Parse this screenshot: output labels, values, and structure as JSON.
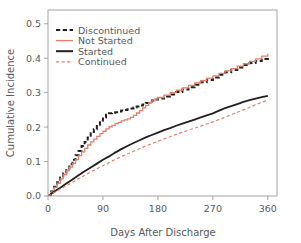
{
  "chart_data": {
    "type": "line",
    "title": "",
    "xlabel": "Days After Discharge",
    "ylabel": "Cumulative Incidence",
    "xlim": [
      0,
      375
    ],
    "ylim": [
      0,
      0.54
    ],
    "xticks": [
      0,
      90,
      180,
      270,
      360
    ],
    "xticklabels": [
      "0",
      "90",
      "180",
      "270",
      "360"
    ],
    "yticks": [
      0.0,
      0.1,
      0.2,
      0.3,
      0.4,
      0.5
    ],
    "yticklabels": [
      "0.0",
      "0.1",
      "0.2",
      "0.3",
      "0.4",
      "0.5"
    ],
    "grid": false,
    "legend_position": "upper-left",
    "colors": {
      "black": "#231f20",
      "red": "#e0806d",
      "axis": "#9a9a9a",
      "text": "#58595b",
      "background": "#ffffff"
    },
    "series": [
      {
        "name": "Discontinued",
        "color": "#231f20",
        "style": "dashed",
        "width": 2.0,
        "x": [
          0,
          5,
          10,
          15,
          20,
          25,
          30,
          35,
          40,
          45,
          50,
          55,
          60,
          65,
          70,
          75,
          80,
          85,
          90,
          95,
          100,
          105,
          110,
          115,
          120,
          125,
          130,
          135,
          140,
          145,
          150,
          155,
          160,
          165,
          170,
          175,
          180,
          190,
          200,
          210,
          220,
          230,
          240,
          250,
          260,
          270,
          280,
          290,
          300,
          310,
          320,
          330,
          340,
          350,
          360
        ],
        "y": [
          0.0,
          0.013,
          0.027,
          0.04,
          0.054,
          0.066,
          0.079,
          0.092,
          0.105,
          0.118,
          0.131,
          0.145,
          0.157,
          0.17,
          0.182,
          0.194,
          0.207,
          0.219,
          0.228,
          0.236,
          0.24,
          0.242,
          0.243,
          0.245,
          0.248,
          0.25,
          0.252,
          0.254,
          0.257,
          0.26,
          0.263,
          0.266,
          0.27,
          0.274,
          0.277,
          0.28,
          0.283,
          0.289,
          0.295,
          0.302,
          0.309,
          0.316,
          0.323,
          0.33,
          0.337,
          0.344,
          0.352,
          0.359,
          0.366,
          0.373,
          0.38,
          0.386,
          0.392,
          0.398,
          0.403
        ]
      },
      {
        "name": "Not Started",
        "color": "#e0806d",
        "style": "solid",
        "width": 1.3,
        "x": [
          0,
          5,
          10,
          15,
          20,
          25,
          30,
          35,
          40,
          45,
          50,
          55,
          60,
          65,
          70,
          75,
          80,
          85,
          90,
          95,
          100,
          105,
          110,
          115,
          120,
          125,
          130,
          135,
          140,
          145,
          150,
          155,
          160,
          165,
          170,
          175,
          180,
          190,
          200,
          210,
          220,
          230,
          240,
          250,
          260,
          270,
          280,
          290,
          300,
          310,
          320,
          330,
          340,
          350,
          360
        ],
        "y": [
          0.0,
          0.012,
          0.025,
          0.037,
          0.05,
          0.062,
          0.073,
          0.084,
          0.095,
          0.106,
          0.117,
          0.128,
          0.138,
          0.148,
          0.157,
          0.165,
          0.173,
          0.181,
          0.188,
          0.195,
          0.201,
          0.205,
          0.21,
          0.214,
          0.218,
          0.221,
          0.224,
          0.228,
          0.234,
          0.241,
          0.248,
          0.256,
          0.263,
          0.27,
          0.276,
          0.281,
          0.286,
          0.293,
          0.3,
          0.307,
          0.314,
          0.321,
          0.328,
          0.335,
          0.342,
          0.349,
          0.356,
          0.363,
          0.37,
          0.377,
          0.384,
          0.391,
          0.398,
          0.406,
          0.413
        ]
      },
      {
        "name": "Started",
        "color": "#231f20",
        "style": "solid",
        "width": 1.8,
        "x": [
          0,
          10,
          20,
          30,
          40,
          50,
          60,
          70,
          80,
          90,
          100,
          110,
          120,
          130,
          140,
          150,
          160,
          170,
          180,
          190,
          200,
          210,
          220,
          230,
          240,
          250,
          260,
          270,
          280,
          290,
          300,
          310,
          320,
          330,
          340,
          350,
          360
        ],
        "y": [
          0.0,
          0.012,
          0.024,
          0.036,
          0.048,
          0.06,
          0.072,
          0.083,
          0.094,
          0.105,
          0.115,
          0.126,
          0.136,
          0.145,
          0.154,
          0.162,
          0.17,
          0.177,
          0.184,
          0.191,
          0.197,
          0.204,
          0.21,
          0.216,
          0.222,
          0.228,
          0.234,
          0.24,
          0.248,
          0.255,
          0.261,
          0.267,
          0.273,
          0.278,
          0.283,
          0.287,
          0.291
        ]
      },
      {
        "name": "Continued",
        "color": "#e0806d",
        "style": "dashed",
        "width": 1.2,
        "x": [
          0,
          10,
          20,
          30,
          40,
          50,
          60,
          70,
          80,
          90,
          100,
          110,
          120,
          130,
          140,
          150,
          160,
          170,
          180,
          190,
          200,
          210,
          220,
          230,
          240,
          250,
          260,
          270,
          280,
          290,
          300,
          310,
          320,
          330,
          340,
          350,
          360
        ],
        "y": [
          0.0,
          0.01,
          0.02,
          0.03,
          0.04,
          0.05,
          0.06,
          0.07,
          0.079,
          0.088,
          0.097,
          0.106,
          0.114,
          0.122,
          0.13,
          0.138,
          0.145,
          0.152,
          0.159,
          0.166,
          0.172,
          0.179,
          0.185,
          0.191,
          0.197,
          0.203,
          0.209,
          0.215,
          0.222,
          0.229,
          0.236,
          0.243,
          0.25,
          0.257,
          0.265,
          0.272,
          0.279
        ]
      }
    ],
    "legend": [
      {
        "label": "Discontinued",
        "color": "#231f20",
        "style": "dashed",
        "width": 2.0
      },
      {
        "label": "Not Started",
        "color": "#e0806d",
        "style": "solid",
        "width": 1.4
      },
      {
        "label": "Started",
        "color": "#231f20",
        "style": "solid",
        "width": 2.0
      },
      {
        "label": "Continued",
        "color": "#e0806d",
        "style": "dashed",
        "width": 1.2
      }
    ]
  }
}
